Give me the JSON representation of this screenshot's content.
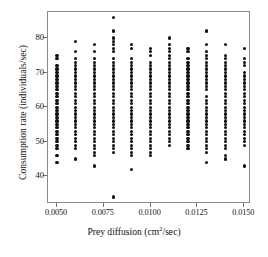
{
  "figure": {
    "background": "#ffffff",
    "frame_color": "#8a8a8a",
    "point_color": "#111111"
  },
  "axis_titles": {
    "x_prefix": "Prey diffusion (cm",
    "x_superscript": "2",
    "x_suffix": "/sec)",
    "x_full": "Prey diffusion (cm2/sec)",
    "y": "Consumption rate (individuals/sec)"
  },
  "chart_data": {
    "type": "scatter",
    "title": "",
    "xlabel": "Prey diffusion (cm2/sec)",
    "ylabel": "Consumption rate (individuals/sec)",
    "xlim": [
      0.00452,
      0.01536
    ],
    "ylim": [
      32.0,
      87.5
    ],
    "grid": false,
    "legend": null,
    "xticks": [
      0.005,
      0.0075,
      0.01,
      0.0125,
      0.015
    ],
    "xticklabels": [
      "0.0050",
      "0.0075",
      "0.0100",
      "0.0125",
      "0.0150"
    ],
    "yticks": [
      40,
      50,
      60,
      70,
      80
    ],
    "yticklabels": [
      "40",
      "50",
      "60",
      "70",
      "80"
    ],
    "marker": "filled-circle",
    "marker_size_px": 3.2,
    "series": [
      {
        "name": "consumption rate",
        "columns": [
          {
            "x": 0.005,
            "y": [
              44,
              46,
              48,
              49,
              50,
              51,
              52,
              53,
              54,
              55,
              56,
              57,
              58,
              59,
              60,
              61,
              62,
              63,
              64,
              65,
              66,
              67,
              68,
              69,
              70,
              71,
              72,
              74,
              75
            ]
          },
          {
            "x": 0.006,
            "y": [
              45,
              48,
              49,
              50,
              51,
              52,
              53,
              54,
              55,
              56,
              57,
              58,
              59,
              60,
              61,
              62,
              63,
              64,
              65,
              66,
              67,
              68,
              69,
              70,
              71,
              72,
              73,
              74,
              76,
              79
            ]
          },
          {
            "x": 0.007,
            "y": [
              43,
              46,
              47,
              48,
              49,
              50,
              51,
              52,
              53,
              54,
              55,
              56,
              57,
              58,
              59,
              60,
              61,
              62,
              63,
              64,
              65,
              66,
              67,
              68,
              69,
              70,
              71,
              72,
              73,
              74,
              76,
              78
            ]
          },
          {
            "x": 0.008,
            "y": [
              34,
              47,
              48,
              49,
              50,
              51,
              52,
              53,
              54,
              55,
              56,
              57,
              58,
              59,
              60,
              61,
              62,
              63,
              64,
              65,
              66,
              67,
              68,
              69,
              70,
              71,
              72,
              73,
              74,
              76,
              77,
              78,
              79,
              80,
              82,
              86
            ]
          },
          {
            "x": 0.009,
            "y": [
              42,
              46,
              47,
              48,
              49,
              50,
              51,
              52,
              53,
              54,
              55,
              56,
              57,
              58,
              59,
              60,
              61,
              62,
              63,
              64,
              65,
              66,
              67,
              68,
              69,
              70,
              71,
              72,
              73,
              74,
              77,
              78
            ]
          },
          {
            "x": 0.01,
            "y": [
              46,
              47,
              48,
              49,
              50,
              51,
              52,
              53,
              54,
              55,
              56,
              57,
              58,
              59,
              60,
              61,
              62,
              63,
              64,
              65,
              66,
              67,
              68,
              69,
              70,
              71,
              72,
              73,
              75,
              76,
              77
            ]
          },
          {
            "x": 0.011,
            "y": [
              49,
              50,
              51,
              52,
              53,
              54,
              55,
              56,
              57,
              58,
              59,
              60,
              61,
              62,
              63,
              64,
              65,
              66,
              67,
              68,
              69,
              70,
              71,
              72,
              73,
              74,
              75,
              76,
              77,
              78,
              80
            ]
          },
          {
            "x": 0.012,
            "y": [
              48,
              49,
              50,
              51,
              52,
              53,
              54,
              55,
              56,
              57,
              58,
              59,
              60,
              61,
              62,
              63,
              64,
              65,
              66,
              67,
              68,
              69,
              70,
              71,
              72,
              73,
              74,
              76,
              77
            ]
          },
          {
            "x": 0.013,
            "y": [
              44,
              47,
              48,
              49,
              50,
              51,
              52,
              53,
              54,
              55,
              56,
              57,
              58,
              59,
              60,
              61,
              62,
              63,
              65,
              66,
              67,
              68,
              69,
              70,
              71,
              72,
              73,
              74,
              75,
              76,
              78,
              82
            ]
          },
          {
            "x": 0.014,
            "y": [
              45,
              46,
              48,
              49,
              50,
              51,
              52,
              53,
              54,
              55,
              56,
              57,
              58,
              59,
              60,
              61,
              62,
              63,
              64,
              65,
              66,
              67,
              68,
              69,
              70,
              71,
              72,
              73,
              74,
              75,
              78
            ]
          },
          {
            "x": 0.015,
            "y": [
              43,
              49,
              50,
              51,
              52,
              53,
              54,
              55,
              56,
              57,
              58,
              59,
              60,
              61,
              62,
              63,
              64,
              65,
              66,
              67,
              68,
              69,
              70,
              72,
              73,
              74,
              77
            ]
          }
        ]
      }
    ]
  }
}
